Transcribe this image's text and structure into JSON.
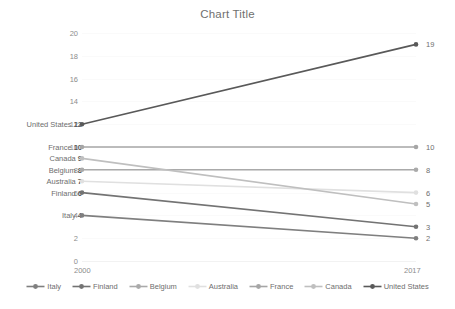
{
  "chart_data": {
    "type": "line",
    "title": "Chart Title",
    "xlabel": "",
    "ylabel": "",
    "x": [
      "2000",
      "2017"
    ],
    "xtick_labels": [
      "2000",
      "2017"
    ],
    "ytick_labels": [
      "0",
      "2",
      "4",
      "6",
      "8",
      "10",
      "12",
      "14",
      "16",
      "18",
      "20"
    ],
    "ylim": [
      0,
      20
    ],
    "ytick_step": 2,
    "grid": true,
    "legend_position": "bottom",
    "series": [
      {
        "name": "Italy",
        "values": [
          4,
          2
        ],
        "color": "#7f7f7f",
        "start_label": "Italy 4",
        "end_label": "2"
      },
      {
        "name": "Finland",
        "values": [
          6,
          3
        ],
        "color": "#737373",
        "start_label": "Finland 6",
        "end_label": "3"
      },
      {
        "name": "Belgium",
        "values": [
          8,
          8
        ],
        "color": "#aaaaaa",
        "start_label": "Belgium 8",
        "end_label": "8"
      },
      {
        "name": "Australia",
        "values": [
          7,
          6
        ],
        "color": "#e0e0e0",
        "start_label": "Australia 7",
        "end_label": "6"
      },
      {
        "name": "France",
        "values": [
          10,
          10
        ],
        "color": "#a6a6a6",
        "start_label": "France 10",
        "end_label": "10"
      },
      {
        "name": "Canada",
        "values": [
          9,
          5
        ],
        "color": "#bfbfbf",
        "start_label": "Canada 9",
        "end_label": "5"
      },
      {
        "name": "United States",
        "values": [
          12,
          19
        ],
        "color": "#595959",
        "start_label": "United States 12",
        "end_label": "19"
      }
    ]
  },
  "legend": {
    "items": [
      {
        "label": "Italy"
      },
      {
        "label": "Finland"
      },
      {
        "label": "Belgium"
      },
      {
        "label": "Australia"
      },
      {
        "label": "France"
      },
      {
        "label": "Canada"
      },
      {
        "label": "United States"
      }
    ]
  }
}
